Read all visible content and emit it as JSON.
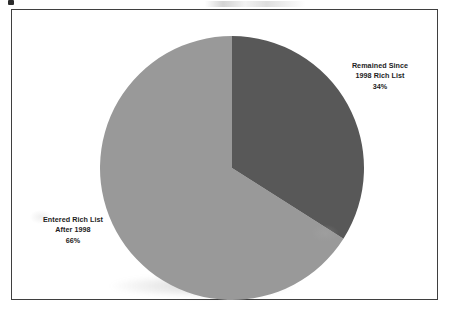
{
  "figure": {
    "background_color": "#ffffff",
    "border_color": "#3f3f3f"
  },
  "chart_data": {
    "type": "pie",
    "title": "",
    "subtitle": "",
    "xlabel": "",
    "ylabel": "",
    "grid": false,
    "legend_position": "none",
    "label_style": "outside-bold-three-line",
    "start_angle_deg": 0,
    "direction": "clockwise",
    "categories": [
      "Remained Since 1998 Rich List",
      "Entered Rich List After 1998"
    ],
    "values": [
      34,
      66
    ],
    "value_unit": "%",
    "slices": [
      {
        "name": "Remained Since 1998 Rich List",
        "value": 34,
        "value_label": "34%",
        "color": "#585858",
        "label_lines": [
          "Remained Since",
          "1998 Rich List",
          "34%"
        ],
        "label_position": "right"
      },
      {
        "name": "Entered Rich List After 1998",
        "value": 66,
        "value_label": "66%",
        "color": "#999999",
        "label_lines": [
          "Entered Rich List",
          "After 1998",
          "66%"
        ],
        "label_position": "left"
      }
    ]
  },
  "labels": {
    "remained": {
      "line1": "Remained Since",
      "line2": "1998 Rich List",
      "line3": "34%"
    },
    "entered": {
      "line1": "Entered Rich List",
      "line2": "After 1998",
      "line3": "66%"
    }
  }
}
